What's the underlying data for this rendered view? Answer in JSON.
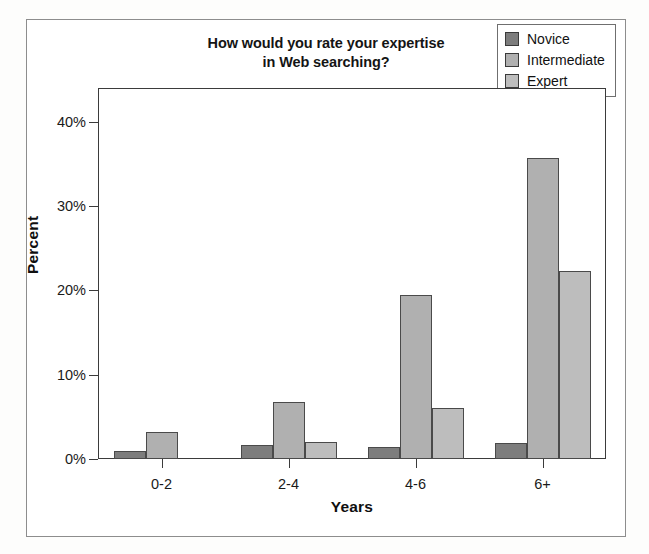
{
  "figure": {
    "title_lines": [
      "How would you rate your expertise",
      "in Web searching?"
    ],
    "caption": ""
  },
  "colors": {
    "novice": "#7d7d7d",
    "intermediate": "#b0b0b0",
    "expert": "#bdbdbd",
    "axis": "#3b3b3b",
    "frame": "#8d8d8d",
    "text": "#141414"
  },
  "legend": {
    "position": "top-right",
    "items": [
      {
        "label": "Novice",
        "color": "#7d7d7d"
      },
      {
        "label": "Intermediate",
        "color": "#b0b0b0"
      },
      {
        "label": "Expert",
        "color": "#bdbdbd"
      }
    ]
  },
  "chart_data": {
    "type": "bar",
    "title": "How would you rate your expertise in Web searching?",
    "xlabel": "Years",
    "ylabel": "Percent",
    "categories": [
      "0-2",
      "2-4",
      "4-6",
      "6+"
    ],
    "series": [
      {
        "name": "Novice",
        "values": [
          1.0,
          1.7,
          1.4,
          1.9
        ]
      },
      {
        "name": "Intermediate",
        "values": [
          3.2,
          6.8,
          19.5,
          35.7
        ]
      },
      {
        "name": "Expert",
        "values": [
          0.0,
          2.0,
          6.0,
          22.3
        ]
      }
    ],
    "ylim": [
      0,
      44
    ],
    "yticks": [
      0,
      10,
      20,
      30,
      40
    ],
    "ytick_labels": [
      "0%",
      "10%",
      "20%",
      "30%",
      "40%"
    ],
    "grid": false,
    "legend_position": "top-right"
  }
}
